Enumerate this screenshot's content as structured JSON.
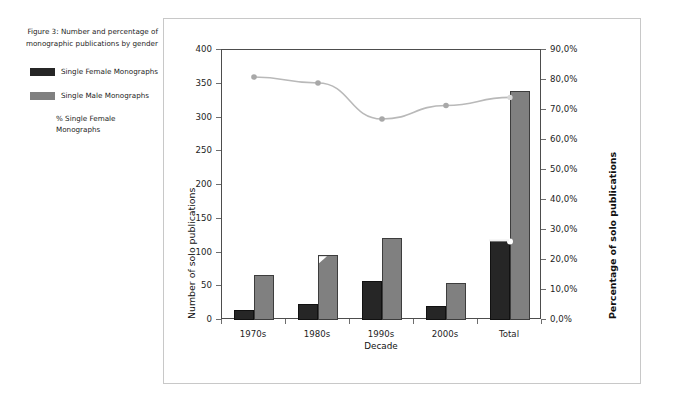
{
  "figure": {
    "caption": "Figure 3: Number and percentage of monographic publications by gender"
  },
  "legend": {
    "items": [
      {
        "label": "Single Female Monographs",
        "swatch": true,
        "color": "#262626"
      },
      {
        "label": "Single Male Monographs",
        "swatch": true,
        "color": "#808080"
      },
      {
        "label": "% Single Female Monographs",
        "swatch": false,
        "color": "#b3b3b3"
      }
    ]
  },
  "axes": {
    "left": {
      "title": "Number of solo publications",
      "ticks": [
        "0",
        "50",
        "100",
        "150",
        "200",
        "250",
        "300",
        "350",
        "400"
      ],
      "min": 0,
      "max": 400,
      "step": 50
    },
    "right": {
      "title": "Percentage of solo publications",
      "ticks": [
        "0,0%",
        "10,0%",
        "20,0%",
        "30,0%",
        "40,0%",
        "50,0%",
        "60,0%",
        "70,0%",
        "80,0%",
        "90,0%"
      ],
      "min": 0,
      "max": 90,
      "step": 10
    },
    "bottom": {
      "title": "Decade",
      "ticks": [
        "1970s",
        "1980s",
        "1990s",
        "2000s",
        "Total"
      ]
    }
  },
  "chart_data": {
    "type": "bar",
    "title": "Figure 3: Number and percentage of monographic publications by gender",
    "xlabel": "Decade",
    "ylabel": "Number of solo publications",
    "y2label": "Percentage of solo publications",
    "categories": [
      "1970s",
      "1980s",
      "1990s",
      "2000s",
      "Total"
    ],
    "ylim": [
      0,
      400
    ],
    "y2lim": [
      0,
      90
    ],
    "grid": false,
    "legend_position": "left-outside",
    "series": [
      {
        "name": "Single Female Monographs",
        "type": "bar",
        "axis": "left",
        "color": "#262626",
        "values": [
          15,
          24,
          58,
          21,
          118
        ]
      },
      {
        "name": "Single Male Monographs",
        "type": "bar",
        "axis": "left",
        "color": "#808080",
        "values": [
          67,
          96,
          121,
          55,
          339
        ]
      },
      {
        "name": "% Single Female Monographs",
        "type": "line",
        "axis": "right",
        "color": "#b9b9b9",
        "marker": "circle",
        "values": [
          81.0,
          79.0,
          67.0,
          71.5,
          74.2
        ]
      }
    ]
  }
}
